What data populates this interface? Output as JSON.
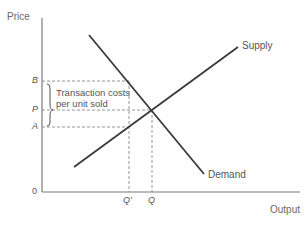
{
  "diagram": {
    "type": "supply-demand",
    "axes": {
      "y_label": "Price",
      "x_label": "Output",
      "origin_label": "0"
    },
    "price_levels": [
      {
        "id": "B",
        "label": "B"
      },
      {
        "id": "P",
        "label": "P"
      },
      {
        "id": "A",
        "label": "A"
      }
    ],
    "quantity_levels": [
      {
        "id": "Qprime",
        "label": "Q'"
      },
      {
        "id": "Q",
        "label": "Q"
      }
    ],
    "curves": {
      "supply": {
        "label": "Supply"
      },
      "demand": {
        "label": "Demand"
      }
    },
    "annotation": {
      "line1": "Transaction costs",
      "line2": "per unit sold"
    },
    "colors": {
      "axis": "#7a7a7a",
      "curve": "#3a3a3a",
      "dashed": "#8a8a8a",
      "text": "#6a6a6a"
    }
  }
}
